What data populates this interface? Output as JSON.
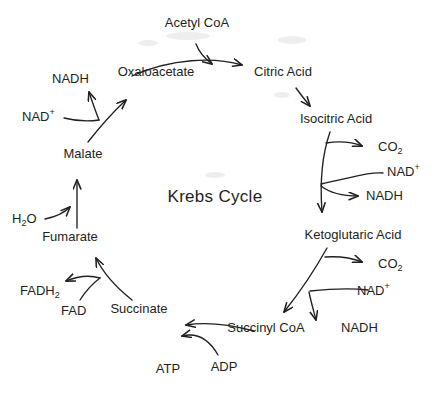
{
  "diagram": {
    "title": "Krebs Cycle",
    "background_color": "#ffffff",
    "ink_color": "#231f20",
    "nodes": {
      "acetyl_coa": "Acetyl CoA",
      "oxaloacetate": "Oxaloacetate",
      "citric_acid": "Citric Acid",
      "isocitric_acid": "Isocitric Acid",
      "ketoglutaric_acid": "Ketoglutaric Acid",
      "succinyl_coa": "Succinyl CoA",
      "succinate": "Succinate",
      "fumarate": "Fumarate",
      "malate": "Malate"
    },
    "cofactors": {
      "nad_plus_malate": "NAD",
      "nad_plus_malate_sup": "+",
      "nadh_malate": "NADH",
      "water": "H",
      "water_sub": "2",
      "water_tail": "O",
      "fad": "FAD",
      "fadh2": "FADH",
      "fadh2_sub": "2",
      "atp": "ATP",
      "adp": "ADP",
      "co2_isocitric": "CO",
      "co2_isocitric_sub": "2",
      "nad_plus_isocitric": "NAD",
      "nad_plus_isocitric_sup": "+",
      "nadh_isocitric": "NADH",
      "co2_ketoglutaric": "CO",
      "co2_ketoglutaric_sub": "2",
      "nad_plus_ketoglutaric": "NAD",
      "nad_plus_ketoglutaric_sup": "+",
      "nadh_ketoglutaric": "NADH"
    }
  }
}
